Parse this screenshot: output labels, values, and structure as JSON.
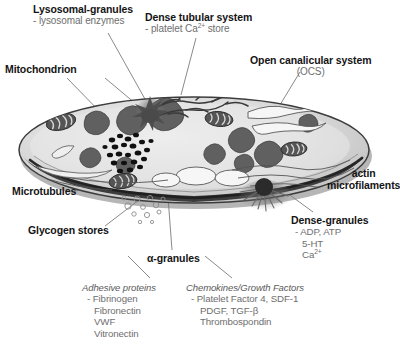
{
  "figure": {
    "background_color": "#ffffff",
    "heading_color": "#141414",
    "subtext_color": "#6e6e6e",
    "cell_fill_color": "#d7d7d7",
    "membrane_color": "#3a3a3a"
  },
  "labels": {
    "lysosomal": {
      "heading": "Lysosomal-granules",
      "sub": "- lysosomal enzymes"
    },
    "mitochondrion": {
      "heading": "Mitochondrion"
    },
    "dense_tubular": {
      "heading": "Dense tubular system",
      "sub_pre": "- platelet Ca",
      "sub_sup": "2+",
      "sub_post": " store"
    },
    "ocs": {
      "heading": "Open canalicular system",
      "sub": "(OCS)"
    },
    "actin": {
      "line1": "actin",
      "line2": "microfilaments"
    },
    "dense_granules": {
      "heading": "Dense-granules",
      "item1": "- ADP, ATP",
      "item2": "5-HT",
      "item3_pre": "Ca",
      "item3_sup": "2+"
    },
    "microtubules": {
      "heading": "Microtubules"
    },
    "glycogen": {
      "heading": "Glycogen stores"
    },
    "alpha_granules": {
      "heading": "α-granules"
    },
    "adhesive_proteins": {
      "heading": "Adhesive proteins",
      "items": [
        "- Fibrinogen",
        "Fibronectin",
        "VWF",
        "Vitronectin"
      ]
    },
    "chemokines": {
      "heading": "Chemokines/Growth Factors",
      "items": [
        "- Platelet Factor 4, SDF-1",
        "PDGF, TGF-β",
        "Thrombospondin"
      ]
    }
  }
}
